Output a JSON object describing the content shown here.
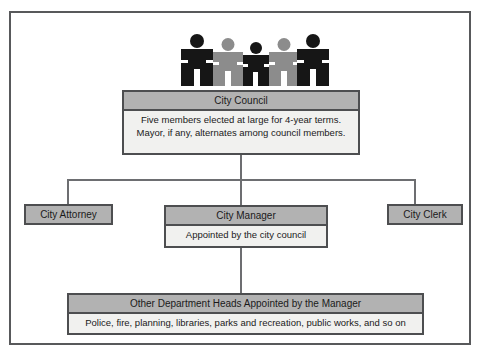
{
  "diagram": {
    "type": "org-chart",
    "colors": {
      "frame_border": "#58595b",
      "box_border": "#4d4e50",
      "header_fill": "#b2b2b2",
      "body_fill": "#f1f1ef",
      "connector": "#6d6e71",
      "figure_dark": "#161616",
      "figure_light": "#8c8c8c"
    },
    "figures": {
      "name": "five-council-members",
      "count": 5,
      "shades": [
        "dark",
        "light",
        "dark",
        "light",
        "dark"
      ]
    },
    "nodes": {
      "council": {
        "header": "City Council",
        "lines": [
          "Five members elected at large for 4-year terms.",
          "Mayor, if any, alternates among council members."
        ]
      },
      "attorney": {
        "header": "City Attorney",
        "lines": []
      },
      "manager": {
        "header": "City Manager",
        "lines": [
          "Appointed by the city council"
        ]
      },
      "clerk": {
        "header": "City Clerk",
        "lines": []
      },
      "departments": {
        "header": "Other Department Heads Appointed by the Manager",
        "lines": [
          "Police, fire, planning, libraries, parks and recreation, public works, and so on"
        ]
      }
    }
  }
}
